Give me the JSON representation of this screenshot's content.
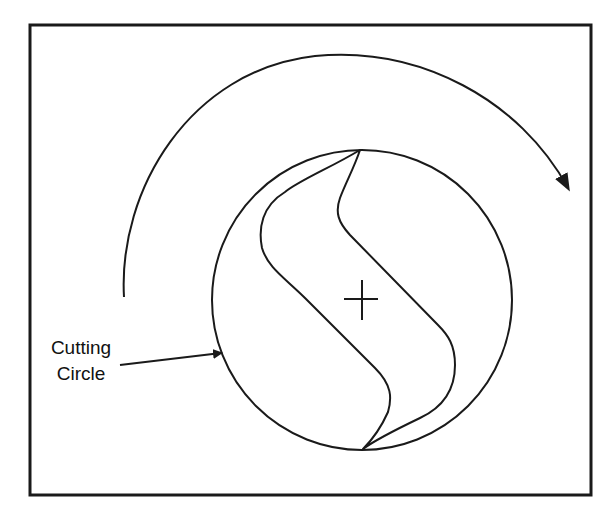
{
  "figure": {
    "labels": {
      "cutting_circle_line1": "Cutting",
      "cutting_circle_line2": "Circle"
    },
    "elements": [
      {
        "name": "frame",
        "type": "rectangle"
      },
      {
        "name": "cutting-circle",
        "type": "circle"
      },
      {
        "name": "rotor-s-profile",
        "type": "closed-curve"
      },
      {
        "name": "center-cross",
        "type": "crosshair"
      },
      {
        "name": "rotation-arrow",
        "type": "curved-arrow",
        "direction": "clockwise"
      },
      {
        "name": "label-leader-arrow",
        "type": "arrow",
        "target": "cutting-circle"
      }
    ],
    "colors": {
      "stroke": "#1a1a1a",
      "background": "#ffffff"
    }
  }
}
